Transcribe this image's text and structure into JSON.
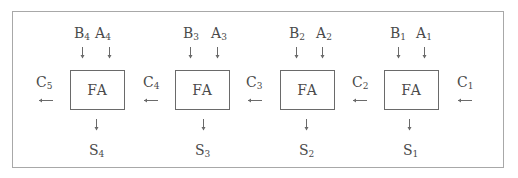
{
  "diagram": {
    "stages": [
      {
        "box": "FA",
        "b": "B",
        "b_sub": "4",
        "a": "A",
        "a_sub": "4",
        "s": "S",
        "s_sub": "4",
        "c_out": "C",
        "c_out_sub": "5",
        "c_in": "C",
        "c_in_sub": "4"
      },
      {
        "box": "FA",
        "b": "B",
        "b_sub": "3",
        "a": "A",
        "a_sub": "3",
        "s": "S",
        "s_sub": "3",
        "c_out": "C",
        "c_out_sub": "4",
        "c_in": "C",
        "c_in_sub": "3"
      },
      {
        "box": "FA",
        "b": "B",
        "b_sub": "2",
        "a": "A",
        "a_sub": "2",
        "s": "S",
        "s_sub": "2",
        "c_out": "C",
        "c_out_sub": "3",
        "c_in": "C",
        "c_in_sub": "2"
      },
      {
        "box": "FA",
        "b": "B",
        "b_sub": "1",
        "a": "A",
        "a_sub": "1",
        "s": "S",
        "s_sub": "1",
        "c_out": "C",
        "c_out_sub": "2",
        "c_in": "C",
        "c_in_sub": "1"
      }
    ],
    "carry_labels": [
      {
        "c": "C",
        "sub": "5"
      },
      {
        "c": "C",
        "sub": "4"
      },
      {
        "c": "C",
        "sub": "3"
      },
      {
        "c": "C",
        "sub": "2"
      },
      {
        "c": "C",
        "sub": "1"
      }
    ],
    "colors": {
      "stroke": "#6a6a6a",
      "frame": "#a8a8a8",
      "text": "#4a4a4a"
    }
  }
}
